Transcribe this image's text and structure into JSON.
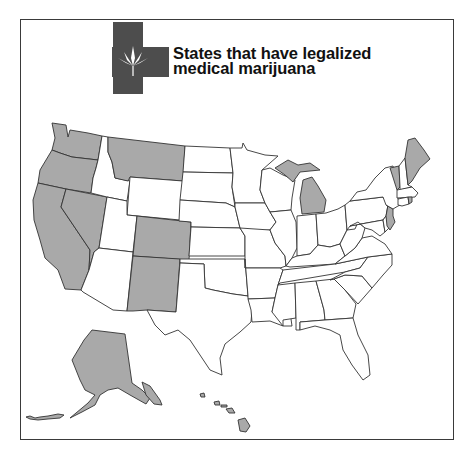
{
  "title": {
    "line1": "States that have legalized",
    "line2": "medical marijuana"
  },
  "icon": {
    "name": "medical-cross-cannabis-leaf-icon"
  },
  "colors": {
    "legalized_fill": "#a9a9a9",
    "other_fill": "#ffffff",
    "border": "#333333",
    "cross": "#4d4d4d"
  },
  "map": {
    "legalized_states": [
      "Washington",
      "Oregon",
      "California",
      "Nevada",
      "Montana",
      "Colorado",
      "New Mexico",
      "Michigan",
      "Vermont",
      "Maine",
      "Rhode Island",
      "New Jersey",
      "Alaska",
      "Hawaii"
    ]
  }
}
